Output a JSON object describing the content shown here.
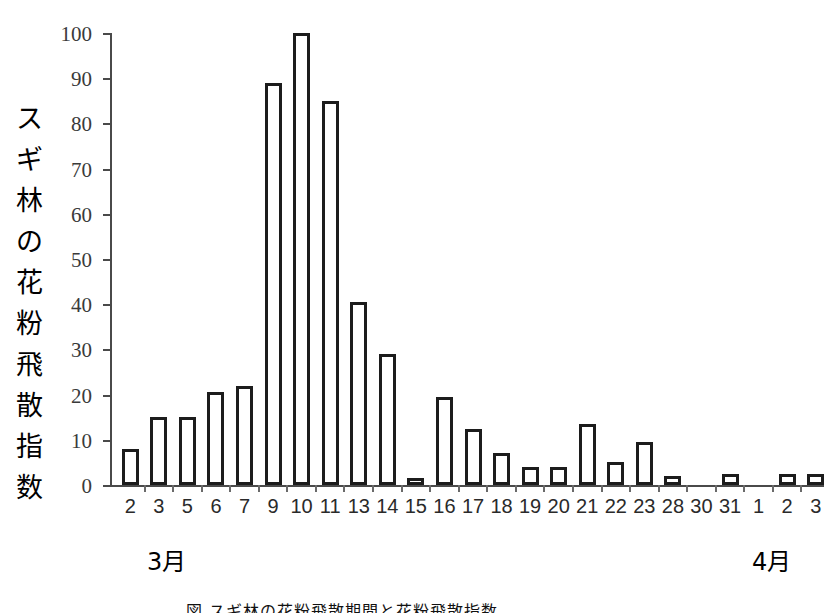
{
  "chart_data": {
    "type": "bar",
    "title": "",
    "xlabel": "",
    "ylabel": "スギ林の花粉飛散指数",
    "ylim": [
      0,
      100
    ],
    "ytick_labels": [
      "0",
      "10",
      "20",
      "30",
      "40",
      "50",
      "60",
      "70",
      "80",
      "90",
      "100"
    ],
    "yticks": [
      0,
      10,
      20,
      30,
      40,
      50,
      60,
      70,
      80,
      90,
      100
    ],
    "grid": false,
    "legend": null,
    "categories": [
      "2",
      "3",
      "5",
      "6",
      "7",
      "9",
      "10",
      "11",
      "13",
      "14",
      "15",
      "16",
      "17",
      "18",
      "19",
      "20",
      "21",
      "22",
      "23",
      "28",
      "30",
      "31",
      "1",
      "2",
      "3"
    ],
    "values": [
      8,
      15,
      15,
      20.5,
      22,
      89,
      100,
      85,
      40.5,
      29,
      1,
      19.5,
      12.5,
      7,
      4,
      4,
      13.5,
      5,
      9.5,
      2,
      0,
      2.5,
      0,
      2.5,
      2.5
    ],
    "annotations": [
      {
        "name": "month-march",
        "text": "3月",
        "span_start": "2",
        "span_end": "31"
      },
      {
        "name": "month-april",
        "text": "4月",
        "span_start": "1",
        "span_end": "3"
      }
    ],
    "bar_style": {
      "fill": "#ffffff",
      "edge": "#1c1c1c",
      "edge_width": 3
    }
  },
  "axis": {
    "y_title": "スギ林の花粉飛散指数",
    "y_title_chars": [
      "ス",
      "ギ",
      "林",
      "の",
      "花",
      "粉",
      "飛",
      "散",
      "指",
      "数"
    ]
  },
  "months": {
    "march": "3月",
    "april": "4月"
  },
  "caption": {
    "text": "図      スギ林の花粉飛散期間と花粉飛散指数"
  },
  "colors": {
    "bar_edge": "#1c1c1c",
    "bar_fill": "#ffffff",
    "axis": "#4a4a4a",
    "text": "#000000",
    "background": "#ffffff"
  }
}
